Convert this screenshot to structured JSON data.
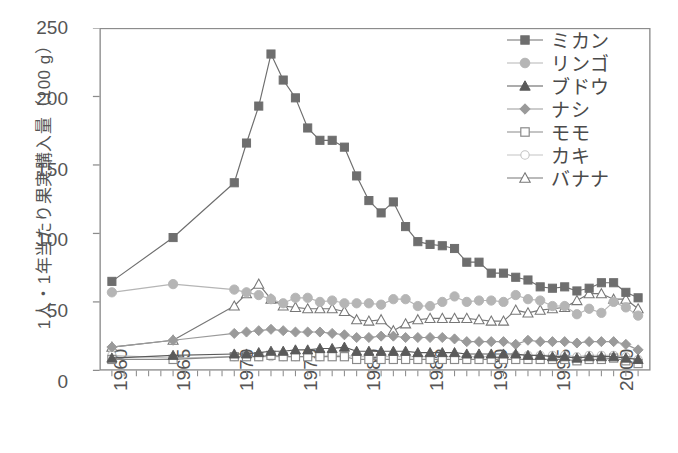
{
  "chart_data": {
    "type": "line",
    "title": "",
    "xlabel": "",
    "ylabel": "1人・1年当たり果実購入量（100 g）",
    "xlim": [
      1959,
      2004
    ],
    "ylim": [
      0,
      250
    ],
    "yticks": [
      0,
      50,
      100,
      150,
      200,
      250
    ],
    "xticks": [
      1960,
      1965,
      1970,
      1975,
      1980,
      1985,
      1990,
      1995,
      2000
    ],
    "xtick_labels": [
      "1960",
      "1965",
      "1970",
      "1975",
      "1980",
      "1985",
      "1990",
      "1995",
      "2000"
    ],
    "ytick_labels": [
      "0",
      "50",
      "100",
      "150",
      "200",
      "250"
    ],
    "grid": false,
    "legend_position": "top-right",
    "x_minor_tick_interval": 1,
    "series": [
      {
        "name": "ミカン",
        "marker": "filled-square",
        "color": "#6e6e6e",
        "x": [
          1960,
          1965,
          1970,
          1971,
          1972,
          1973,
          1974,
          1975,
          1976,
          1977,
          1978,
          1979,
          1980,
          1981,
          1982,
          1983,
          1984,
          1985,
          1986,
          1987,
          1988,
          1989,
          1990,
          1991,
          1992,
          1993,
          1994,
          1995,
          1996,
          1997,
          1998,
          1999,
          2000,
          2001,
          2002,
          2003
        ],
        "values": [
          65,
          97,
          137,
          166,
          193,
          231,
          212,
          199,
          177,
          168,
          168,
          163,
          142,
          124,
          115,
          123,
          105,
          94,
          92,
          91,
          89,
          79,
          79,
          71,
          71,
          68,
          66,
          61,
          60,
          61,
          58,
          60,
          64,
          64,
          57,
          53
        ]
      },
      {
        "name": "リンゴ",
        "marker": "filled-circle",
        "color": "#b5b5b5",
        "x": [
          1960,
          1965,
          1970,
          1971,
          1972,
          1973,
          1974,
          1975,
          1976,
          1977,
          1978,
          1979,
          1980,
          1981,
          1982,
          1983,
          1984,
          1985,
          1986,
          1987,
          1988,
          1989,
          1990,
          1991,
          1992,
          1993,
          1994,
          1995,
          1996,
          1997,
          1998,
          1999,
          2000,
          2001,
          2002,
          2003
        ],
        "values": [
          57,
          63,
          59,
          57,
          55,
          52,
          49,
          53,
          53,
          50,
          51,
          49,
          49,
          49,
          48,
          52,
          52,
          47,
          47,
          50,
          54,
          50,
          51,
          51,
          50,
          55,
          52,
          51,
          47,
          47,
          41,
          45,
          42,
          50,
          46,
          40
        ]
      },
      {
        "name": "ブドウ",
        "marker": "filled-triangle",
        "color": "#5a5a5a",
        "x": [
          1960,
          1965,
          1970,
          1971,
          1972,
          1973,
          1974,
          1975,
          1976,
          1977,
          1978,
          1979,
          1980,
          1981,
          1982,
          1983,
          1984,
          1985,
          1986,
          1987,
          1988,
          1989,
          1990,
          1991,
          1992,
          1993,
          1994,
          1995,
          1996,
          1997,
          1998,
          1999,
          2000,
          2001,
          2002,
          2003
        ],
        "values": [
          9,
          11,
          12,
          12,
          13,
          14,
          14,
          15,
          15,
          16,
          16,
          17,
          14,
          14,
          14,
          14,
          14,
          13,
          13,
          13,
          13,
          12,
          12,
          12,
          12,
          12,
          11,
          11,
          10,
          10,
          9,
          10,
          10,
          10,
          9,
          8
        ]
      },
      {
        "name": "ナシ",
        "marker": "filled-diamond",
        "color": "#9a9a9a",
        "x": [
          1960,
          1965,
          1970,
          1971,
          1972,
          1973,
          1974,
          1975,
          1976,
          1977,
          1978,
          1979,
          1980,
          1981,
          1982,
          1983,
          1984,
          1985,
          1986,
          1987,
          1988,
          1989,
          1990,
          1991,
          1992,
          1993,
          1994,
          1995,
          1996,
          1997,
          1998,
          1999,
          2000,
          2001,
          2002,
          2003
        ],
        "values": [
          17,
          22,
          27,
          28,
          29,
          30,
          29,
          28,
          28,
          28,
          27,
          26,
          24,
          24,
          25,
          25,
          24,
          24,
          24,
          24,
          23,
          21,
          21,
          21,
          21,
          19,
          22,
          21,
          21,
          21,
          20,
          21,
          21,
          21,
          19,
          15
        ]
      },
      {
        "name": "モモ",
        "marker": "open-square",
        "color": "#8a8a8a",
        "x": [
          1960,
          1965,
          1970,
          1971,
          1972,
          1973,
          1974,
          1975,
          1976,
          1977,
          1978,
          1979,
          1980,
          1981,
          1982,
          1983,
          1984,
          1985,
          1986,
          1987,
          1988,
          1989,
          1990,
          1991,
          1992,
          1993,
          1994,
          1995,
          1996,
          1997,
          1998,
          1999,
          2000,
          2001,
          2002,
          2003
        ],
        "values": [
          8,
          8,
          10,
          10,
          10,
          11,
          10,
          10,
          10,
          10,
          10,
          10,
          8,
          8,
          8,
          8,
          8,
          8,
          8,
          8,
          8,
          8,
          8,
          8,
          8,
          8,
          8,
          8,
          8,
          8,
          7,
          8,
          8,
          9,
          7,
          5
        ]
      },
      {
        "name": "カキ",
        "marker": "open-circle",
        "color": "#c4c4c4",
        "x": [
          1960,
          1965,
          1970,
          1971,
          1972,
          1973,
          1974,
          1975,
          1976,
          1977,
          1978,
          1979,
          1980,
          1981,
          1982,
          1983,
          1984,
          1985,
          1986,
          1987,
          1988,
          1989,
          1990,
          1991,
          1992,
          1993,
          1994,
          1995,
          1996,
          1997,
          1998,
          1999,
          2000,
          2001,
          2002,
          2003
        ],
        "values": [
          11,
          9,
          10,
          10,
          10,
          10,
          10,
          10,
          10,
          10,
          11,
          11,
          10,
          10,
          10,
          10,
          10,
          10,
          10,
          10,
          10,
          10,
          10,
          10,
          10,
          11,
          11,
          11,
          11,
          11,
          10,
          11,
          11,
          11,
          10,
          8
        ]
      },
      {
        "name": "バナナ",
        "marker": "open-triangle",
        "color": "#777777",
        "x": [
          1960,
          1965,
          1970,
          1971,
          1972,
          1973,
          1974,
          1975,
          1976,
          1977,
          1978,
          1979,
          1980,
          1981,
          1982,
          1983,
          1984,
          1985,
          1986,
          1987,
          1988,
          1989,
          1990,
          1991,
          1992,
          1993,
          1994,
          1995,
          1996,
          1997,
          1998,
          1999,
          2000,
          2001,
          2002,
          2003
        ],
        "values": [
          17,
          22,
          47,
          56,
          63,
          52,
          47,
          46,
          45,
          45,
          45,
          43,
          37,
          36,
          37,
          29,
          34,
          37,
          38,
          38,
          38,
          38,
          37,
          36,
          36,
          44,
          42,
          44,
          45,
          46,
          51,
          56,
          56,
          52,
          52,
          45
        ]
      }
    ]
  },
  "legend": {
    "items": [
      {
        "label": "ミカン"
      },
      {
        "label": "リンゴ"
      },
      {
        "label": "ブドウ"
      },
      {
        "label": "ナシ"
      },
      {
        "label": "モモ"
      },
      {
        "label": "カキ"
      },
      {
        "label": "バナナ"
      }
    ]
  },
  "axis": {
    "y_title": "1人・1年当たり果実購入量（100 g）"
  }
}
